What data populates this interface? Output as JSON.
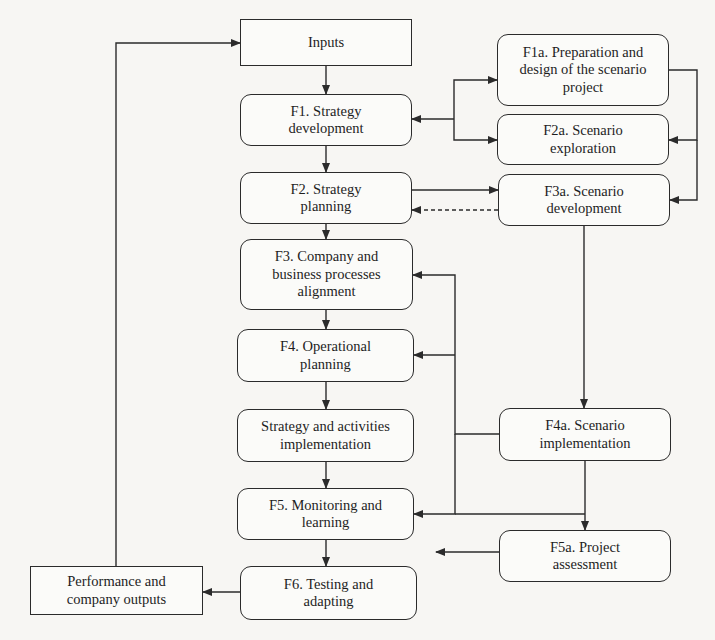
{
  "diagram": {
    "title": "",
    "colors": {
      "stroke": "#2b2b2b",
      "text": "#1e1e1e",
      "box_fill": "#fbfbf9",
      "background": "#f7f6f3"
    },
    "nodes": [
      {
        "id": "inputs",
        "label": "Inputs",
        "shape": "square",
        "x": 240,
        "y": 19,
        "w": 172,
        "h": 47
      },
      {
        "id": "f1",
        "label": "F1. Strategy\ndevelopment",
        "shape": "rounded",
        "x": 240,
        "y": 94,
        "w": 172,
        "h": 52
      },
      {
        "id": "f2",
        "label": "F2. Strategy\nplanning",
        "shape": "rounded",
        "x": 240,
        "y": 172,
        "w": 172,
        "h": 52
      },
      {
        "id": "f3",
        "label": "F3. Company and\nbusiness processes\nalignment",
        "shape": "rounded",
        "x": 240,
        "y": 239,
        "w": 173,
        "h": 71
      },
      {
        "id": "f4",
        "label": "F4. Operational\nplanning",
        "shape": "rounded",
        "x": 237,
        "y": 329,
        "w": 177,
        "h": 53
      },
      {
        "id": "sai",
        "label": "Strategy and activities\nimplementation",
        "shape": "rounded",
        "x": 237,
        "y": 409,
        "w": 177,
        "h": 53
      },
      {
        "id": "f5",
        "label": "F5. Monitoring and\nlearning",
        "shape": "rounded",
        "x": 237,
        "y": 488,
        "w": 177,
        "h": 52
      },
      {
        "id": "f6",
        "label": "F6. Testing and\nadapting",
        "shape": "rounded",
        "x": 240,
        "y": 566,
        "w": 177,
        "h": 54
      },
      {
        "id": "perf",
        "label": "Performance and\ncompany outputs",
        "shape": "square",
        "x": 30,
        "y": 566,
        "w": 173,
        "h": 49
      },
      {
        "id": "f1a",
        "label": "F1a. Preparation and\ndesign of the scenario\nproject",
        "shape": "rounded",
        "x": 497,
        "y": 34,
        "w": 172,
        "h": 72
      },
      {
        "id": "f2a",
        "label": "F2a. Scenario\nexploration",
        "shape": "rounded",
        "x": 497,
        "y": 114,
        "w": 172,
        "h": 51
      },
      {
        "id": "f3a",
        "label": "F3a. Scenario\ndevelopment",
        "shape": "rounded",
        "x": 498,
        "y": 174,
        "w": 172,
        "h": 52
      },
      {
        "id": "f4a",
        "label": "F4a. Scenario\nimplementation",
        "shape": "rounded",
        "x": 499,
        "y": 408,
        "w": 172,
        "h": 53
      },
      {
        "id": "f5a",
        "label": "F5a. Project\nassessment",
        "shape": "rounded",
        "x": 499,
        "y": 530,
        "w": 172,
        "h": 52
      }
    ],
    "edges": [
      {
        "id": "inputs-to-f1",
        "from": "inputs",
        "to": "f1",
        "style": "solid",
        "arrow": "end",
        "points": [
          [
            326,
            66
          ],
          [
            326,
            94
          ]
        ]
      },
      {
        "id": "f1-to-f2",
        "from": "f1",
        "to": "f2",
        "style": "solid",
        "arrow": "end",
        "points": [
          [
            326,
            146
          ],
          [
            326,
            172
          ]
        ]
      },
      {
        "id": "f2-to-f3",
        "from": "f2",
        "to": "f3",
        "style": "solid",
        "arrow": "end",
        "points": [
          [
            326,
            224
          ],
          [
            326,
            239
          ]
        ]
      },
      {
        "id": "f3-to-f4",
        "from": "f3",
        "to": "f4",
        "style": "solid",
        "arrow": "end",
        "points": [
          [
            326,
            310
          ],
          [
            326,
            329
          ]
        ]
      },
      {
        "id": "f4-to-sai",
        "from": "f4",
        "to": "sai",
        "style": "solid",
        "arrow": "end",
        "points": [
          [
            326,
            382
          ],
          [
            326,
            409
          ]
        ]
      },
      {
        "id": "sai-to-f5",
        "from": "sai",
        "to": "f5",
        "style": "solid",
        "arrow": "end",
        "points": [
          [
            326,
            462
          ],
          [
            326,
            488
          ]
        ]
      },
      {
        "id": "f5-to-f6",
        "from": "f5",
        "to": "f6",
        "style": "solid",
        "arrow": "end",
        "points": [
          [
            326,
            540
          ],
          [
            326,
            566
          ]
        ]
      },
      {
        "id": "f6-to-perf",
        "from": "f6",
        "to": "perf",
        "style": "solid",
        "arrow": "end",
        "points": [
          [
            240,
            592
          ],
          [
            203,
            592
          ]
        ]
      },
      {
        "id": "perf-to-inputs",
        "from": "perf",
        "to": "inputs",
        "style": "solid",
        "arrow": "end",
        "points": [
          [
            116,
            566
          ],
          [
            116,
            43
          ],
          [
            240,
            43
          ]
        ]
      },
      {
        "id": "hub-to-f1",
        "from": "f1a",
        "to": "f1",
        "style": "solid",
        "arrow": "end",
        "points": [
          [
            454,
            119
          ],
          [
            412,
            119
          ]
        ]
      },
      {
        "id": "hub-to-f1a",
        "from": "f1",
        "to": "f1a",
        "style": "solid",
        "arrow": "end",
        "points": [
          [
            454,
            119
          ],
          [
            454,
            80
          ],
          [
            497,
            80
          ]
        ]
      },
      {
        "id": "hub-to-f2a",
        "from": "f1",
        "to": "f2a",
        "style": "solid",
        "arrow": "end",
        "points": [
          [
            454,
            119
          ],
          [
            454,
            140
          ],
          [
            497,
            140
          ]
        ]
      },
      {
        "id": "f1a-to-f2a",
        "from": "f1a",
        "to": "f2a",
        "style": "solid",
        "arrow": "end",
        "points": [
          [
            669,
            70
          ],
          [
            697,
            70
          ],
          [
            697,
            140
          ],
          [
            669,
            140
          ]
        ]
      },
      {
        "id": "f1a-to-f3a",
        "from": "f1a",
        "to": "f3a",
        "style": "solid",
        "arrow": "end",
        "points": [
          [
            697,
            140
          ],
          [
            697,
            200
          ],
          [
            670,
            200
          ]
        ]
      },
      {
        "id": "f2-to-f3a",
        "from": "f2",
        "to": "f3a",
        "style": "solid",
        "arrow": "end",
        "points": [
          [
            412,
            190
          ],
          [
            498,
            190
          ]
        ]
      },
      {
        "id": "f3a-to-f2",
        "from": "f3a",
        "to": "f2",
        "style": "dashed",
        "arrow": "end",
        "points": [
          [
            498,
            210
          ],
          [
            412,
            210
          ]
        ]
      },
      {
        "id": "f3a-to-f4a",
        "from": "f3a",
        "to": "f4a",
        "style": "solid",
        "arrow": "end",
        "points": [
          [
            584,
            226
          ],
          [
            584,
            408
          ]
        ]
      },
      {
        "id": "f4a-to-f3",
        "from": "f4a",
        "to": "f3",
        "style": "solid",
        "arrow": "end",
        "points": [
          [
            499,
            434
          ],
          [
            455,
            434
          ],
          [
            455,
            275
          ],
          [
            413,
            275
          ]
        ]
      },
      {
        "id": "f4a-to-f4",
        "from": "f4a",
        "to": "f4",
        "style": "solid",
        "arrow": "end",
        "points": [
          [
            455,
            355
          ],
          [
            414,
            355
          ]
        ]
      },
      {
        "id": "f4a-to-f5",
        "from": "f4a",
        "to": "f5",
        "style": "solid",
        "arrow": "end",
        "points": [
          [
            455,
            434
          ],
          [
            455,
            514
          ],
          [
            414,
            514
          ]
        ]
      },
      {
        "id": "f4a-to-f5a",
        "from": "f4a",
        "to": "f5a",
        "style": "solid",
        "arrow": "end",
        "points": [
          [
            585,
            461
          ],
          [
            585,
            530
          ]
        ]
      },
      {
        "id": "f5a-to-f5-line",
        "from": "f5a",
        "to": "f5",
        "style": "solid",
        "arrow": "none",
        "points": [
          [
            585,
            514
          ],
          [
            455,
            514
          ]
        ]
      },
      {
        "id": "f5a-to-left",
        "from": "f5a",
        "to": "f6",
        "style": "solid",
        "arrow": "end",
        "points": [
          [
            499,
            552
          ],
          [
            436,
            552
          ]
        ]
      }
    ]
  }
}
